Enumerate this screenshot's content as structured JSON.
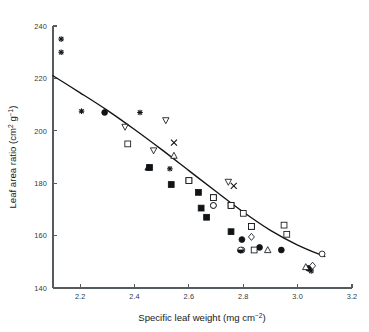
{
  "chart_data": {
    "type": "scatter",
    "title": "",
    "xlabel": "Specific leaf weight (mg cm⁻²)",
    "ylabel": "Leaf area ratio (cm² g⁻¹)",
    "xlabel_parts": {
      "main": "Specific leaf weight (mg cm",
      "sup": "−2",
      "tail": ")"
    },
    "ylabel_parts": {
      "main": "Leaf area ratio (cm",
      "sup1": "2",
      "mid": " g",
      "sup2": "−1",
      "tail": ")"
    },
    "xlim": [
      2.1,
      3.2
    ],
    "ylim": [
      140,
      240
    ],
    "xticks": [
      2.2,
      2.4,
      2.6,
      2.8,
      3.0,
      3.2
    ],
    "xtick_labels": [
      "2.2",
      "2.4",
      "2.6",
      "2.8",
      "3.0",
      "3.2"
    ],
    "yticks": [
      140,
      160,
      180,
      200,
      220,
      240
    ],
    "ytick_labels": [
      "140",
      "160",
      "180",
      "200",
      "220",
      "240"
    ],
    "grid": false,
    "legend": "none",
    "series": [
      {
        "name": "star-markers",
        "marker": "star",
        "fill": "filled",
        "points": [
          [
            2.13,
            235.0
          ],
          [
            2.13,
            230.0
          ],
          [
            2.205,
            207.5
          ],
          [
            2.42,
            207.0
          ],
          [
            2.455,
            186.0
          ],
          [
            2.53,
            185.5
          ],
          [
            3.05,
            146.5
          ]
        ]
      },
      {
        "name": "filled-circles",
        "marker": "circle",
        "fill": "filled",
        "points": [
          [
            2.29,
            207.0
          ],
          [
            2.69,
            171.5
          ],
          [
            2.795,
            158.5
          ],
          [
            2.86,
            155.5
          ],
          [
            2.94,
            154.5
          ],
          [
            3.04,
            147.5
          ]
        ]
      },
      {
        "name": "filled-squares",
        "marker": "square",
        "fill": "filled",
        "points": [
          [
            2.455,
            186.0
          ],
          [
            2.535,
            179.5
          ],
          [
            2.6,
            181.0
          ],
          [
            2.635,
            176.5
          ],
          [
            2.645,
            170.5
          ],
          [
            2.665,
            167.0
          ],
          [
            2.69,
            174.5
          ],
          [
            2.755,
            171.5
          ],
          [
            2.755,
            161.5
          ],
          [
            2.83,
            163.5
          ]
        ]
      },
      {
        "name": "open-squares",
        "marker": "square",
        "fill": "open",
        "points": [
          [
            2.375,
            195.0
          ],
          [
            2.6,
            181.0
          ],
          [
            2.69,
            174.5
          ],
          [
            2.755,
            171.5
          ],
          [
            2.8,
            168.5
          ],
          [
            2.83,
            163.5
          ],
          [
            2.84,
            154.5
          ],
          [
            2.95,
            164.0
          ],
          [
            2.96,
            160.5
          ]
        ]
      },
      {
        "name": "open-down-triangles",
        "marker": "triangle-down",
        "fill": "open",
        "points": [
          [
            2.365,
            201.5
          ],
          [
            2.47,
            192.5
          ],
          [
            2.515,
            204.0
          ],
          [
            2.745,
            180.5
          ]
        ]
      },
      {
        "name": "open-up-triangles",
        "marker": "triangle-up",
        "fill": "open",
        "points": [
          [
            2.545,
            190.5
          ],
          [
            2.89,
            154.5
          ],
          [
            3.03,
            148.0
          ]
        ]
      },
      {
        "name": "filled-up-triangles",
        "marker": "triangle-up",
        "fill": "filled",
        "points": [
          [
            2.45,
            186.0
          ]
        ]
      },
      {
        "name": "cross-markers",
        "marker": "x",
        "fill": "open",
        "points": [
          [
            2.545,
            195.5
          ],
          [
            2.765,
            179.0
          ]
        ]
      },
      {
        "name": "open-diamonds",
        "marker": "diamond",
        "fill": "open",
        "points": [
          [
            2.83,
            159.5
          ],
          [
            3.055,
            148.5
          ]
        ]
      },
      {
        "name": "open-circles",
        "marker": "circle",
        "fill": "open",
        "points": [
          [
            2.69,
            171.5
          ],
          [
            2.795,
            154.5
          ],
          [
            3.09,
            153.0
          ]
        ]
      },
      {
        "name": "half-filled-circles",
        "marker": "circle-half",
        "fill": "half",
        "points": [
          [
            2.79,
            154.5
          ]
        ]
      }
    ],
    "fit_curve": {
      "description": "fitted declining curve",
      "points": [
        [
          2.1,
          221.0
        ],
        [
          2.2,
          214.5
        ],
        [
          2.3,
          207.8
        ],
        [
          2.4,
          200.5
        ],
        [
          2.5,
          192.8
        ],
        [
          2.6,
          184.8
        ],
        [
          2.7,
          176.8
        ],
        [
          2.8,
          169.0
        ],
        [
          2.9,
          162.0
        ],
        [
          3.0,
          156.4
        ],
        [
          3.1,
          152.0
        ]
      ]
    }
  }
}
